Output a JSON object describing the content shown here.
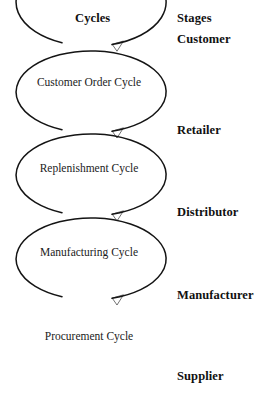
{
  "diagram": {
    "headers": {
      "cycles": "Cycles",
      "stages": "Stages"
    },
    "cycles": [
      {
        "label": "Customer Order Cycle"
      },
      {
        "label": "Replenishment Cycle"
      },
      {
        "label": "Manufacturing Cycle"
      },
      {
        "label": "Procurement Cycle"
      }
    ],
    "stages": [
      {
        "label": "Customer"
      },
      {
        "label": "Retailer"
      },
      {
        "label": "Distributor"
      },
      {
        "label": "Manufacturer"
      },
      {
        "label": "Supplier"
      }
    ],
    "colors": {
      "background": "#ffffff",
      "stroke": "#141414",
      "header_text": "#111111",
      "cycle_text": "#1b1b1b"
    }
  }
}
